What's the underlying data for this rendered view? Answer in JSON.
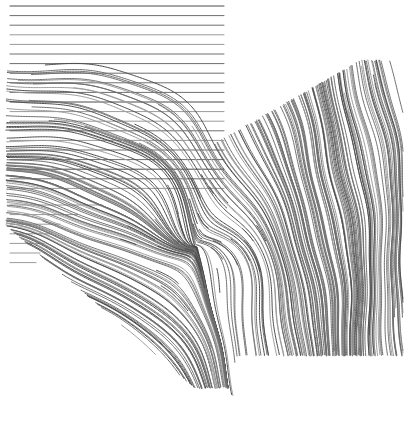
{
  "canvas": {
    "width": 413,
    "height": 426,
    "background": "#ffffff",
    "title": "Fingerprint ridge flow reconstruction"
  },
  "style": {
    "ridge_color": "#6e6e6e",
    "ridge_color_light": "#9a9a9a",
    "ridge_color_dark": "#4a4a4a",
    "line_width": 1,
    "line_cap": "round"
  },
  "chart_data": {
    "type": "line",
    "title": "Fingerprint ridge flow reconstruction",
    "xlabel": "",
    "ylabel": "",
    "xlim": [
      0,
      413
    ],
    "ylim": [
      0,
      426
    ],
    "grid": false,
    "legend": "none",
    "notes": "Thin grey ridge curves traced over a fingerprint orientation field. Upper-left block is a padded flat region of perfectly horizontal ridges; a diagonal band sweeps down-right; the right portion is a near-vertical ridge bundle. A delta singularity sits near (196,246).",
    "singularities": [
      {
        "name": "delta",
        "x": 196,
        "y": 246
      },
      {
        "name": "core",
        "x": 150,
        "y": 225
      }
    ],
    "regions": [
      {
        "name": "flat-horizontal-block",
        "orientation_deg": 0,
        "x_start": 10,
        "x_end": 224,
        "y_start": 6,
        "y_end": 196,
        "spacing": 9.6,
        "count": 20
      },
      {
        "name": "left-truncated-stubs",
        "orientation_deg": 0,
        "x_start": 10,
        "y_start": 205,
        "y_end": 262,
        "spacing": 9.6,
        "count": 7,
        "lengths": [
          92,
          68,
          50,
          40,
          34,
          30,
          26
        ]
      },
      {
        "name": "upper-right-diagonal-band",
        "orientation_deg": 70,
        "top_edge_from": [
          224,
          140
        ],
        "top_edge_to": [
          362,
          62
        ],
        "spacing": 9.0,
        "count": 22
      },
      {
        "name": "right-vertical-bundle",
        "orientation_deg": 88,
        "x_start": 196,
        "x_end": 396,
        "y_start": 150,
        "y_end": 352,
        "spacing": 8.6,
        "count": 24
      },
      {
        "name": "lower-left-diagonal-sweep",
        "orientation_deg": 40,
        "x_start": 34,
        "x_end": 215,
        "y_start": 210,
        "y_end": 392,
        "spacing": 9.4,
        "count": 18
      }
    ],
    "series": [
      {
        "name": "flat-horizontal-block",
        "color": "#6e6e6e",
        "kind": "horizontal-rows",
        "x0": 10,
        "x1": 224,
        "y0": 6,
        "dy": 9.6,
        "rows": 20
      },
      {
        "name": "left-truncated-stubs",
        "color": "#8a8a8a",
        "kind": "horizontal-stubs",
        "x0": 10,
        "y0": 205,
        "dy": 9.6,
        "lengths": [
          92,
          68,
          50,
          40,
          34,
          30,
          26
        ]
      },
      {
        "name": "upper-right-diagonal-band",
        "color": "#6e6e6e",
        "kind": "flow",
        "seed_from": [
          222,
          142
        ],
        "seed_to": [
          364,
          60
        ],
        "seeds": 23
      },
      {
        "name": "mid-diagonal-band",
        "color": "#6e6e6e",
        "kind": "flow",
        "seed_from": [
          14,
          212
        ],
        "seed_to": [
          210,
          150
        ],
        "seeds": 20
      },
      {
        "name": "lower-left-sweep",
        "color": "#6e6e6e",
        "kind": "flow",
        "seed_from": [
          30,
          232
        ],
        "seed_to": [
          120,
          318
        ],
        "seeds": 14
      },
      {
        "name": "right-vertical-bundle",
        "color": "#6e6e6e",
        "kind": "flow",
        "seed_from": [
          198,
          176
        ],
        "seed_to": [
          396,
          140
        ],
        "seeds": 24
      }
    ]
  }
}
